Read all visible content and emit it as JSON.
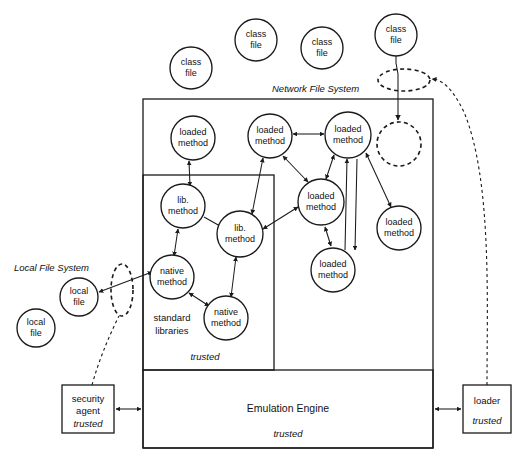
{
  "diagram": {
    "regions": [
      {
        "id": "network-file-system",
        "label": "Network File System",
        "x": 272,
        "y": 89
      },
      {
        "id": "local-file-system",
        "label": "Local File System",
        "x": 14,
        "y": 268
      }
    ],
    "class_files": [
      {
        "id": "class-file-1",
        "label_line1": "class",
        "label_line2": "file",
        "cx": 191,
        "cy": 68,
        "r": 21
      },
      {
        "id": "class-file-2",
        "label_line1": "class",
        "label_line2": "file",
        "cx": 256,
        "cy": 40,
        "r": 21
      },
      {
        "id": "class-file-3",
        "label_line1": "class",
        "label_line2": "file",
        "cx": 322,
        "cy": 48,
        "r": 21
      },
      {
        "id": "class-file-4",
        "label_line1": "class",
        "label_line2": "file",
        "cx": 396,
        "cy": 35,
        "r": 21
      }
    ],
    "local_files": [
      {
        "id": "local-file-1",
        "label_line1": "local",
        "label_line2": "file",
        "cx": 79,
        "cy": 297,
        "r": 19
      },
      {
        "id": "local-file-2",
        "label_line1": "local",
        "label_line2": "file",
        "cx": 36,
        "cy": 328,
        "r": 19
      }
    ],
    "loaded_methods": [
      {
        "id": "loaded-method-1",
        "label_line1": "loaded",
        "label_line2": "method",
        "cx": 193,
        "cy": 138,
        "r": 22
      },
      {
        "id": "loaded-method-2",
        "label_line1": "loaded",
        "label_line2": "method",
        "cx": 270,
        "cy": 136,
        "r": 22
      },
      {
        "id": "loaded-method-3",
        "label_line1": "loaded",
        "label_line2": "method",
        "cx": 348,
        "cy": 135,
        "r": 23
      },
      {
        "id": "loaded-method-4",
        "label_line1": "loaded",
        "label_line2": "method",
        "cx": 321,
        "cy": 202,
        "r": 23
      },
      {
        "id": "loaded-method-5",
        "label_line1": "loaded",
        "label_line2": "method",
        "cx": 333,
        "cy": 270,
        "r": 22
      },
      {
        "id": "loaded-method-6",
        "label_line1": "loaded",
        "label_line2": "method",
        "cx": 399,
        "cy": 228,
        "r": 22
      }
    ],
    "lib_methods": [
      {
        "id": "lib-method-1",
        "label_line1": "lib.",
        "label_line2": "method",
        "cx": 183,
        "cy": 206,
        "r": 22
      },
      {
        "id": "lib-method-2",
        "label_line1": "lib.",
        "label_line2": "method",
        "cx": 240,
        "cy": 234,
        "r": 23
      }
    ],
    "native_methods": [
      {
        "id": "native-method-1",
        "label_line1": "native",
        "label_line2": "method",
        "cx": 172,
        "cy": 277,
        "r": 22
      },
      {
        "id": "native-method-2",
        "label_line1": "native",
        "label_line2": "method",
        "cx": 226,
        "cy": 318,
        "r": 22
      }
    ],
    "empty_slot": {
      "id": "empty-loaded-slot",
      "cx": 399,
      "cy": 144,
      "r": 22
    },
    "nfs_ellipse": {
      "id": "network-transfer-ellipse",
      "cx": 404,
      "cy": 80,
      "rx": 26,
      "ry": 11
    },
    "lfs_ellipse": {
      "id": "local-transfer-ellipse",
      "cx": 122,
      "cy": 290,
      "rx": 11,
      "ry": 26
    },
    "boxes": {
      "jvm_outer": {
        "id": "jvm-box",
        "x": 143,
        "y": 99,
        "w": 290,
        "h": 349
      },
      "standard_libraries": {
        "id": "standard-libraries-box",
        "x": 143,
        "y": 175,
        "w": 131,
        "h": 195,
        "label": "standard\nlibraries",
        "label_line1": "standard",
        "label_line2": "libraries",
        "label_x": 172,
        "label_y": 324,
        "trusted_label": "trusted",
        "trusted_x": 205,
        "trusted_y": 360
      },
      "emulation_engine": {
        "id": "emulation-engine-box",
        "x": 143,
        "y": 370,
        "w": 290,
        "h": 78,
        "label": "Emulation Engine",
        "label_x": 288,
        "label_y": 409,
        "trusted_label": "trusted",
        "trusted_x": 288,
        "trusted_y": 435
      },
      "security_agent": {
        "id": "security-agent-box",
        "x": 62,
        "y": 385,
        "w": 52,
        "h": 48,
        "label_line1": "security",
        "label_line2": "agent",
        "trusted_label": "trusted"
      },
      "loader": {
        "id": "loader-box",
        "x": 463,
        "y": 385,
        "w": 48,
        "h": 48,
        "label": "loader",
        "trusted_label": "trusted"
      }
    },
    "colors": {
      "stroke": "#1a1a1a",
      "text": "#111111",
      "background": "#ffffff"
    }
  }
}
